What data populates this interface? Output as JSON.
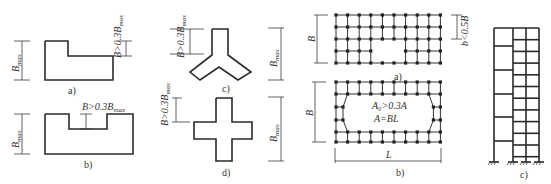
{
  "figure": {
    "panels_left": {
      "a": {
        "caption": "a)",
        "dim_left": "B",
        "dim_left_sub": "max",
        "dim_right": "B>0.3B",
        "dim_right_sub": "max"
      },
      "b": {
        "caption": "b)",
        "dim_left": "B",
        "dim_left_sub": "max",
        "dim_top": "B>0.3B",
        "dim_top_sub": "max"
      },
      "c": {
        "caption": "c)",
        "dim_left": "B>0.3B",
        "dim_left_sub": "max"
      },
      "d": {
        "caption": "d)",
        "dim_left": "B>0.3B",
        "dim_left_sub": "max"
      },
      "e_dim": {
        "dim": "B",
        "dim_sub": "max"
      }
    },
    "panels_grid": {
      "a": {
        "caption": "a)",
        "dim_left": "B",
        "dim_right": "b<0.5B"
      },
      "b": {
        "caption": "b)",
        "dim_left": "B",
        "dim_bottom": "L",
        "note1": "A₀>0.3A",
        "note2": "A=BL"
      }
    },
    "panel_frame": {
      "caption": "c)"
    }
  }
}
